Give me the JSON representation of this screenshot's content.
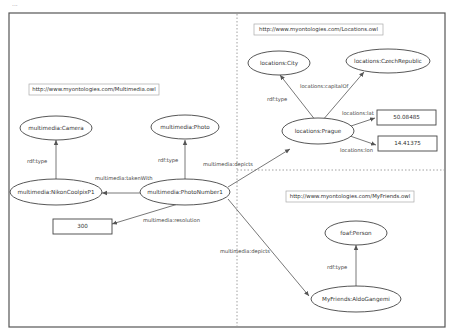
{
  "top_fragment": "...",
  "regions": {
    "multimedia": {
      "namespace": "http://www.myontologies.com/Multimedia.owl"
    },
    "locations": {
      "namespace": "http://www.myontologies.com/Locations.owl"
    },
    "myfriends": {
      "namespace": "http://www.myontologies.com/MyFriends.owl"
    }
  },
  "nodes": {
    "camera": "multimedia:Camera",
    "photo": "multimedia:Photo",
    "nikon": "multimedia:NikonCoolpixP1",
    "photonumber": "multimedia:PhotoNumber1",
    "resolution_value": "300",
    "city": "locations:City",
    "czech": "locations:CzechRepublic",
    "prague": "locations:Prague",
    "lat_value": "50.08485",
    "lon_value": "14.41375",
    "foafperson": "foaf:Person",
    "aldo": "MyFriends:AldoGangemi"
  },
  "edges": {
    "nikon_type": "rdf:type",
    "photo_type": "rdf:type",
    "taken_with": "multimedia:takenWith",
    "resolution": "multimedia:resolution",
    "depicts_prague": "multimedia:depicts",
    "depicts_aldo": "multimedia:depicts",
    "prague_type": "rdf:type",
    "capital_of": "locations:capitalOf",
    "lat": "locations:lat",
    "lon": "locations:lon",
    "aldo_type": "rdf:type"
  },
  "colors": {
    "stroke": "#444444",
    "divider": "#888888",
    "background": "#ffffff"
  }
}
